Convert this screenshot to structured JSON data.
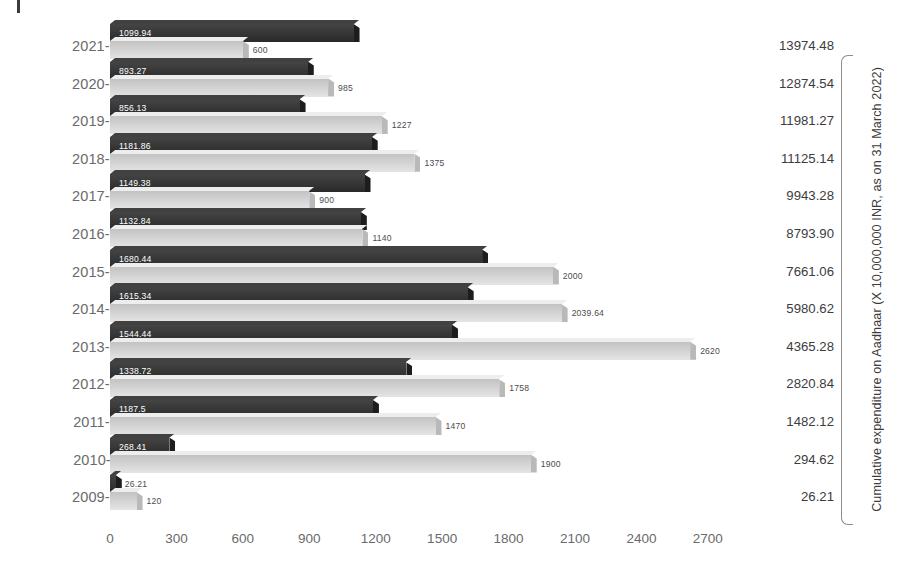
{
  "chart_data": {
    "type": "bar",
    "orientation": "horizontal",
    "title": "",
    "xlabel": "",
    "ylabel": "",
    "xlim": [
      0,
      2800
    ],
    "xticks": [
      0,
      300,
      600,
      900,
      1200,
      1500,
      1800,
      2100,
      2400,
      2700
    ],
    "grid": false,
    "legend": null,
    "categories": [
      "2021-22",
      "2020-21",
      "2019-20",
      "2018-19",
      "2017-18",
      "2016-17",
      "2015-16",
      "2014-15",
      "2013-14",
      "2012-13",
      "2011-12",
      "2010-11",
      "2009-10"
    ],
    "series": [
      {
        "name": "Expenditure",
        "style": "dark",
        "values": [
          1099.94,
          893.27,
          856.13,
          1181.86,
          1149.38,
          1132.84,
          1680.44,
          1615.34,
          1544.44,
          1338.72,
          1187.5,
          268.41,
          26.21
        ],
        "labels": [
          "1099.94",
          "893.27",
          "856.13",
          "1181.86",
          "1149.38",
          "1132.84",
          "1680.44",
          "1615.34",
          "1544.44",
          "1338.72",
          "1187.5",
          "268.41",
          "26.21"
        ]
      },
      {
        "name": "Budget",
        "style": "light",
        "values": [
          600,
          985,
          1227,
          1375,
          900,
          1140,
          2000,
          2039.64,
          2620,
          1758,
          1470,
          1900,
          120
        ],
        "labels": [
          "600",
          "985",
          "1227",
          "1375",
          "900",
          "1140",
          "2000",
          "2039.64",
          "2620",
          "1758",
          "1470",
          "1900",
          "120"
        ]
      }
    ],
    "cumulative": {
      "axis_title": "Cumulative expenditure on Aadhaar (X 10,000,000 INR, as on 31 March 2022)",
      "values": [
        "13974.48",
        "12874.54",
        "11981.27",
        "11125.14",
        "9943.28",
        "8793.90",
        "7661.06",
        "5980.62",
        "4365.28",
        "2820.84",
        "1482.12",
        "294.62",
        "26.21"
      ]
    },
    "colors": {
      "dark_bar": "#2f2f30",
      "light_bar": "#d9d9d9",
      "text": "#6a6a6c",
      "value_text": "#3c3c3e",
      "background": "#ffffff"
    }
  }
}
